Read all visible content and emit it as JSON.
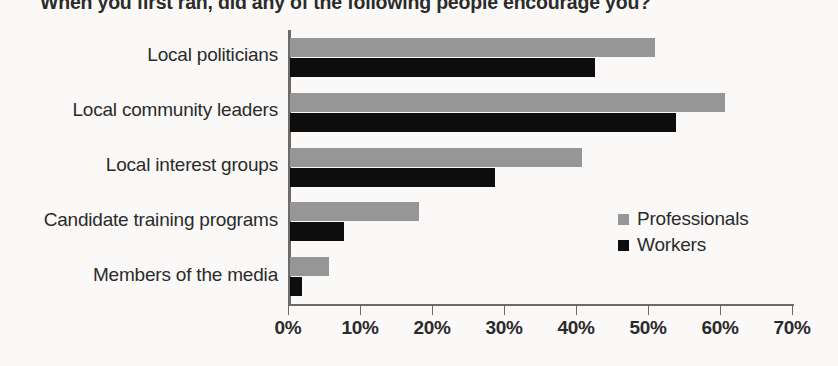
{
  "chart_data": {
    "type": "bar",
    "orientation": "horizontal",
    "title": "When you first ran, did any of the following people encourage you?",
    "xlabel": "",
    "ylabel": "",
    "xlim": [
      0,
      70
    ],
    "xticks": [
      "0%",
      "10%",
      "20%",
      "30%",
      "40%",
      "50%",
      "60%",
      "70%"
    ],
    "xtick_values": [
      0,
      10,
      20,
      30,
      40,
      50,
      60,
      70
    ],
    "grid": false,
    "legend_position": "inside-right",
    "categories": [
      "Local politicians",
      "Local community leaders",
      "Local interest groups",
      "Candidate training programs",
      "Members of the media"
    ],
    "series": [
      {
        "name": "Professionals",
        "color": "#969696",
        "values": [
          50.7,
          60.4,
          40.6,
          17.9,
          5.4
        ]
      },
      {
        "name": "Workers",
        "color": "#0d0d0d",
        "values": [
          42.4,
          53.6,
          28.5,
          7.5,
          1.7
        ]
      }
    ]
  }
}
